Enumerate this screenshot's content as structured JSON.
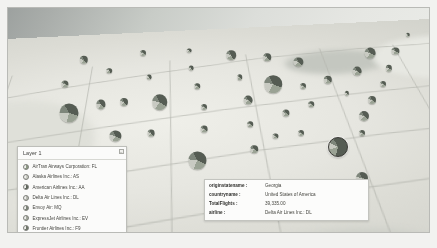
{
  "app": {
    "view_title": "3D tilted choropleth map of the United States with pie-chart markers per state"
  },
  "legend": {
    "title": "Layer 1",
    "collapse_icon": "chevron-collapse-icon",
    "collapse_glyph": "–",
    "items": [
      {
        "label": "AirTran Airways Corporation: FL",
        "code": "FL",
        "color": "#8e9a86",
        "swatch_icon": "pie-swatch-icon"
      },
      {
        "label": "Alaska Airlines Inc.: AS",
        "code": "AS",
        "color": "#c9cbc3",
        "swatch_icon": "pie-swatch-icon"
      },
      {
        "label": "American Airlines Inc.: AA",
        "code": "AA",
        "color": "#5e655c",
        "swatch_icon": "pie-swatch-icon"
      },
      {
        "label": "Delta Air Lines Inc.: DL",
        "code": "DL",
        "color": "#b7b9b1",
        "swatch_icon": "pie-swatch-icon"
      },
      {
        "label": "Envoy Air: MQ",
        "code": "MQ",
        "color": "#7d857a",
        "swatch_icon": "pie-swatch-icon"
      },
      {
        "label": "ExpressJet Airlines Inc.: EV",
        "code": "EV",
        "color": "#a3a79c",
        "swatch_icon": "pie-swatch-icon"
      },
      {
        "label": "Frontier Airlines Inc.: F9",
        "code": "F9",
        "color": "#6f776b",
        "swatch_icon": "pie-swatch-icon"
      },
      {
        "label": "JetBlue Airways: B6",
        "code": "B6",
        "color": "#d2d4cc",
        "swatch_icon": "pie-swatch-icon"
      }
    ]
  },
  "info_panel": {
    "rows": [
      {
        "key": "originstatename :",
        "value": "Georgia"
      },
      {
        "key": "countryname :",
        "value": "United States of America"
      },
      {
        "key": "TotalFlights :",
        "value": "39,335.00"
      },
      {
        "key": "airline :",
        "value": "Delta Air Lines Inc.: DL"
      }
    ]
  },
  "chart_data": {
    "type": "pie",
    "series_label": "airline",
    "value_label": "TotalFlights",
    "legend_position": "bottom-left",
    "selected_marker": {
      "state": "Georgia",
      "total_flights": 39335,
      "airline": "Delta Air Lines Inc.: DL"
    },
    "markers": [
      {
        "state": "Washington",
        "x": 18.0,
        "y": 23.0,
        "r": 4.2,
        "slices": [
          46,
          22,
          18,
          14
        ]
      },
      {
        "state": "Oregon",
        "x": 13.5,
        "y": 34.0,
        "r": 3.6,
        "slices": [
          40,
          26,
          20,
          14
        ]
      },
      {
        "state": "California",
        "x": 14.5,
        "y": 47.0,
        "r": 9.5,
        "slices": [
          38,
          24,
          21,
          17
        ]
      },
      {
        "state": "Nevada",
        "x": 22.0,
        "y": 43.0,
        "r": 4.6,
        "slices": [
          44,
          23,
          19,
          14
        ]
      },
      {
        "state": "Idaho",
        "x": 24.0,
        "y": 28.0,
        "r": 2.8,
        "slices": [
          52,
          20,
          16,
          12
        ]
      },
      {
        "state": "Utah",
        "x": 27.5,
        "y": 42.0,
        "r": 4.0,
        "slices": [
          48,
          22,
          18,
          12
        ]
      },
      {
        "state": "Arizona",
        "x": 25.5,
        "y": 57.0,
        "r": 5.6,
        "slices": [
          41,
          25,
          20,
          14
        ]
      },
      {
        "state": "Montana",
        "x": 32.0,
        "y": 20.0,
        "r": 3.0,
        "slices": [
          45,
          25,
          18,
          12
        ]
      },
      {
        "state": "Wyoming",
        "x": 33.5,
        "y": 31.0,
        "r": 2.4,
        "slices": [
          50,
          22,
          17,
          11
        ]
      },
      {
        "state": "Colorado",
        "x": 36.0,
        "y": 42.0,
        "r": 7.8,
        "slices": [
          42,
          26,
          18,
          14
        ]
      },
      {
        "state": "New Mexico",
        "x": 34.0,
        "y": 56.0,
        "r": 3.4,
        "slices": [
          46,
          23,
          18,
          13
        ]
      },
      {
        "state": "North Dakota",
        "x": 43.0,
        "y": 19.0,
        "r": 2.4,
        "slices": [
          44,
          26,
          18,
          12
        ]
      },
      {
        "state": "South Dakota",
        "x": 43.5,
        "y": 27.0,
        "r": 2.4,
        "slices": [
          47,
          24,
          17,
          12
        ]
      },
      {
        "state": "Nebraska",
        "x": 45.0,
        "y": 35.0,
        "r": 2.8,
        "slices": [
          45,
          24,
          19,
          12
        ]
      },
      {
        "state": "Kansas",
        "x": 46.5,
        "y": 44.0,
        "r": 3.0,
        "slices": [
          43,
          26,
          19,
          12
        ]
      },
      {
        "state": "Oklahoma",
        "x": 46.5,
        "y": 54.0,
        "r": 3.4,
        "slices": [
          44,
          25,
          18,
          13
        ]
      },
      {
        "state": "Texas",
        "x": 45.0,
        "y": 68.0,
        "r": 8.6,
        "slices": [
          40,
          25,
          20,
          15
        ]
      },
      {
        "state": "Minnesota",
        "x": 53.0,
        "y": 21.0,
        "r": 4.8,
        "slices": [
          50,
          22,
          16,
          12
        ]
      },
      {
        "state": "Iowa",
        "x": 55.0,
        "y": 31.0,
        "r": 2.8,
        "slices": [
          46,
          24,
          18,
          12
        ]
      },
      {
        "state": "Missouri",
        "x": 57.0,
        "y": 41.0,
        "r": 4.4,
        "slices": [
          43,
          25,
          19,
          13
        ]
      },
      {
        "state": "Arkansas",
        "x": 57.5,
        "y": 52.0,
        "r": 2.8,
        "slices": [
          45,
          24,
          18,
          13
        ]
      },
      {
        "state": "Louisiana",
        "x": 58.5,
        "y": 63.0,
        "r": 3.8,
        "slices": [
          42,
          26,
          19,
          13
        ]
      },
      {
        "state": "Wisconsin",
        "x": 61.5,
        "y": 22.0,
        "r": 3.8,
        "slices": [
          47,
          23,
          18,
          12
        ]
      },
      {
        "state": "Illinois",
        "x": 63.0,
        "y": 34.0,
        "r": 8.8,
        "slices": [
          39,
          27,
          20,
          14
        ]
      },
      {
        "state": "Tennessee",
        "x": 66.0,
        "y": 47.0,
        "r": 3.6,
        "slices": [
          44,
          25,
          18,
          13
        ]
      },
      {
        "state": "Mississippi",
        "x": 63.5,
        "y": 57.0,
        "r": 2.6,
        "slices": [
          46,
          24,
          18,
          12
        ]
      },
      {
        "state": "Michigan",
        "x": 69.0,
        "y": 24.0,
        "r": 4.6,
        "slices": [
          45,
          24,
          18,
          13
        ]
      },
      {
        "state": "Indiana",
        "x": 70.0,
        "y": 35.0,
        "r": 3.0,
        "slices": [
          44,
          25,
          18,
          13
        ]
      },
      {
        "state": "Kentucky",
        "x": 72.0,
        "y": 43.0,
        "r": 2.8,
        "slices": [
          45,
          24,
          18,
          13
        ]
      },
      {
        "state": "Alabama",
        "x": 69.5,
        "y": 56.0,
        "r": 3.0,
        "slices": [
          45,
          25,
          18,
          12
        ]
      },
      {
        "state": "Ohio",
        "x": 76.0,
        "y": 32.0,
        "r": 4.2,
        "slices": [
          43,
          25,
          19,
          13
        ]
      },
      {
        "state": "Georgia",
        "x": 78.5,
        "y": 62.0,
        "r": 9.0,
        "slices": [
          62,
          16,
          12,
          10
        ],
        "selected": true
      },
      {
        "state": "Florida",
        "x": 84.0,
        "y": 76.0,
        "r": 6.0,
        "slices": [
          38,
          27,
          21,
          14
        ]
      },
      {
        "state": "West Virginia",
        "x": 80.5,
        "y": 38.0,
        "r": 2.2,
        "slices": [
          46,
          24,
          18,
          12
        ]
      },
      {
        "state": "Pennsylvania",
        "x": 83.0,
        "y": 28.0,
        "r": 4.4,
        "slices": [
          42,
          26,
          19,
          13
        ]
      },
      {
        "state": "New York",
        "x": 86.0,
        "y": 20.0,
        "r": 5.4,
        "slices": [
          40,
          27,
          20,
          13
        ]
      },
      {
        "state": "North Carolina",
        "x": 84.5,
        "y": 48.0,
        "r": 5.0,
        "slices": [
          44,
          25,
          18,
          13
        ]
      },
      {
        "state": "South Carolina",
        "x": 84.0,
        "y": 56.0,
        "r": 3.0,
        "slices": [
          45,
          25,
          18,
          12
        ]
      },
      {
        "state": "Virginia",
        "x": 86.5,
        "y": 41.0,
        "r": 4.0,
        "slices": [
          43,
          26,
          18,
          13
        ]
      },
      {
        "state": "Maryland",
        "x": 89.0,
        "y": 34.0,
        "r": 3.0,
        "slices": [
          44,
          25,
          18,
          13
        ]
      },
      {
        "state": "New Jersey",
        "x": 90.5,
        "y": 27.0,
        "r": 3.2,
        "slices": [
          41,
          27,
          19,
          13
        ]
      },
      {
        "state": "Massachusetts",
        "x": 92.0,
        "y": 19.0,
        "r": 3.6,
        "slices": [
          42,
          26,
          19,
          13
        ]
      },
      {
        "state": "Maine",
        "x": 95.0,
        "y": 12.0,
        "r": 2.2,
        "slices": [
          48,
          23,
          17,
          12
        ]
      }
    ],
    "slice_colors": [
      "#555c53",
      "#9aa294",
      "#c8cac2",
      "#7e867b"
    ]
  }
}
